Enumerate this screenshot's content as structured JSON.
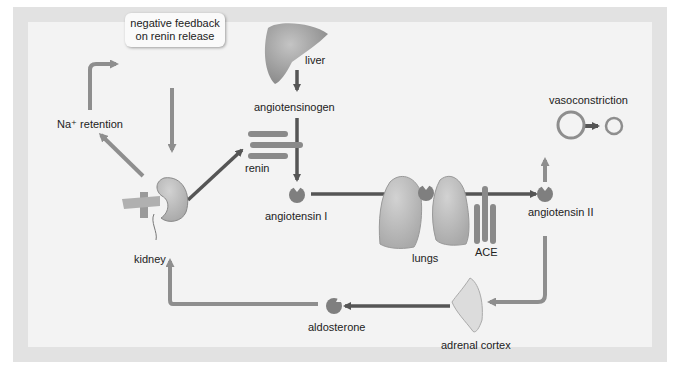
{
  "diagram": {
    "labels": {
      "feedback_line1": "negative feedback",
      "feedback_line2": "on renin release",
      "na_retention": "Na⁺ retention",
      "liver": "liver",
      "angiotensinogen": "angiotensinogen",
      "renin": "renin",
      "angiotensin_i": "angiotensin I",
      "kidney": "kidney",
      "lungs": "lungs",
      "ace": "ACE",
      "angiotensin_ii": "angiotensin II",
      "vasoconstriction": "vasoconstriction",
      "aldosterone": "aldosterone",
      "adrenal_cortex": "adrenal cortex"
    },
    "nodes": [
      {
        "id": "liver",
        "icon": "liver-icon"
      },
      {
        "id": "kidney",
        "icon": "kidney-icon"
      },
      {
        "id": "renin",
        "icon": "enzyme-icon"
      },
      {
        "id": "angiotensin_i",
        "icon": "molecule-icon"
      },
      {
        "id": "lungs",
        "icon": "lungs-icon"
      },
      {
        "id": "ace",
        "icon": "enzyme-icon"
      },
      {
        "id": "angiotensin_ii",
        "icon": "molecule-icon"
      },
      {
        "id": "vasoconstriction",
        "icon": "vessel-icon"
      },
      {
        "id": "adrenal_cortex",
        "icon": "adrenal-icon"
      },
      {
        "id": "aldosterone",
        "icon": "molecule-icon"
      }
    ],
    "edges": [
      {
        "from": "liver",
        "to": "angiotensinogen"
      },
      {
        "from": "angiotensinogen",
        "to": "angiotensin_i",
        "via": "renin"
      },
      {
        "from": "kidney",
        "to": "renin"
      },
      {
        "from": "angiotensin_i",
        "to": "angiotensin_ii",
        "via": "ACE (lungs)"
      },
      {
        "from": "angiotensin_ii",
        "to": "vasoconstriction"
      },
      {
        "from": "angiotensin_ii",
        "to": "adrenal_cortex"
      },
      {
        "from": "adrenal_cortex",
        "to": "aldosterone"
      },
      {
        "from": "aldosterone",
        "to": "kidney"
      },
      {
        "from": "kidney",
        "to": "na_retention"
      },
      {
        "from": "na_retention",
        "to": "negative_feedback"
      },
      {
        "from": "negative_feedback",
        "to": "kidney"
      }
    ],
    "colors": {
      "frame": "#e2e2e2",
      "panel": "#f3f3f3",
      "dark_arrow": "#5b5b5b",
      "light_arrow": "#8e8e8e",
      "organ": "#9a9a9a",
      "organ_light": "#b9b9b9"
    }
  }
}
